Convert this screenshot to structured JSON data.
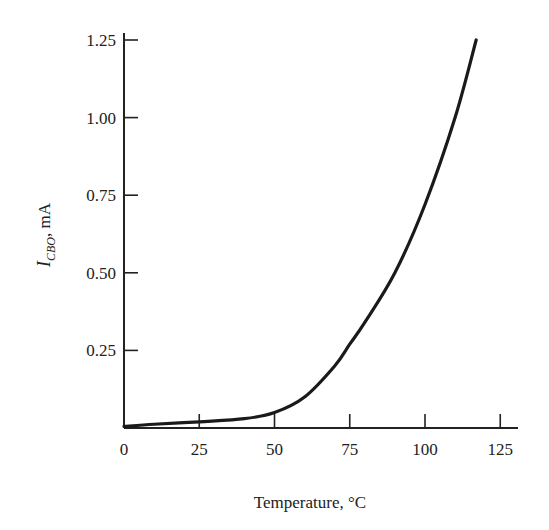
{
  "chart_data": {
    "type": "line",
    "title": "",
    "xlabel": "Temperature, °C",
    "ylabel": "I_CBO, mA",
    "ylabel_parts": {
      "main": "I",
      "sub": "CBO",
      "rest": ", mA"
    },
    "xlim": [
      0,
      130
    ],
    "ylim": [
      0,
      1.25
    ],
    "xticks": [
      0,
      25,
      50,
      75,
      100,
      125
    ],
    "xtick_labels": [
      "0",
      "25",
      "50",
      "75",
      "100",
      "125"
    ],
    "yticks": [
      0.25,
      0.5,
      0.75,
      1.0,
      1.25
    ],
    "ytick_labels": [
      "0.25",
      "0.50",
      "0.75",
      "1.00",
      "1.25"
    ],
    "grid": false,
    "legend": null,
    "series": [
      {
        "name": "I_CBO vs Temperature",
        "color": "#1a1a1a",
        "x": [
          0,
          10,
          25,
          40,
          50,
          60,
          70,
          75,
          80,
          90,
          100,
          110,
          117
        ],
        "y": [
          0.005,
          0.012,
          0.02,
          0.03,
          0.05,
          0.1,
          0.2,
          0.27,
          0.34,
          0.5,
          0.72,
          1.0,
          1.25
        ]
      }
    ]
  }
}
